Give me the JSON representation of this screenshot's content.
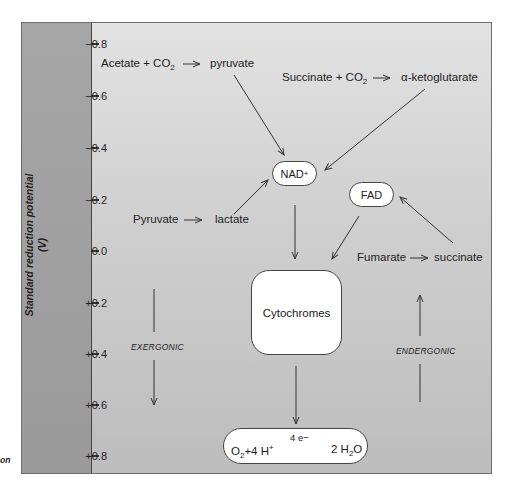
{
  "axis": {
    "title_line1": "Standard reduction potential",
    "title_line2": "(V)",
    "ticks": [
      "−0.8",
      "−0.6",
      "−0.4",
      "−0.2",
      "0.0",
      "+0.2",
      "+0.4",
      "+0.6",
      "+0.8"
    ]
  },
  "reactions": {
    "acetate": {
      "left": "Acetate  +  CO",
      "sub": "2",
      "product": "pyruvate"
    },
    "succinate_co2": {
      "left": "Succinate  +  CO",
      "sub": "2",
      "product": "α-ketoglutarate"
    },
    "pyruvate_lactate": {
      "left": "Pyruvate",
      "product": "lactate"
    },
    "fumarate_succinate": {
      "left": "Fumarate",
      "product": "succinate"
    }
  },
  "carriers": {
    "nad": {
      "label": "NAD",
      "sup": "+"
    },
    "fad": {
      "label": "FAD"
    },
    "cytochromes": {
      "label": "Cytochromes"
    }
  },
  "terminal": {
    "o2": "O",
    "o2_sub": "2",
    "plus": "+4 H",
    "h_sup": "+",
    "electrons": "4 e−",
    "water_pre": "2 H",
    "water_sub": "2",
    "water_post": "O"
  },
  "labels": {
    "exergonic": "EXERGONIC",
    "endergonic": "ENDERGONIC"
  },
  "caption_fragment": "on",
  "colors": {
    "panel": "#cfcfcf",
    "axis_strip": "#a0a0a0",
    "box_fill": "#ffffff",
    "line": "#333333"
  }
}
